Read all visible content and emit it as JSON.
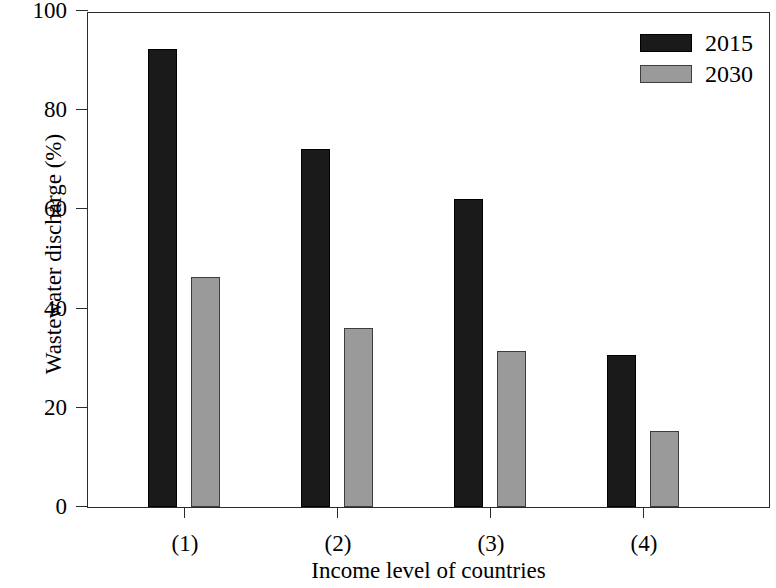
{
  "chart_data": {
    "type": "bar",
    "title": "",
    "subtitle": "",
    "xlabel": "Income level of countries",
    "ylabel": "Wastewater discharge (%)",
    "categories": [
      "(1)",
      "(2)",
      "(3)",
      "(4)"
    ],
    "series": [
      {
        "name": "2015",
        "color": "#1a1a1a",
        "values": [
          92.3,
          72.2,
          62.1,
          30.6
        ]
      },
      {
        "name": "2030",
        "color": "#9a9a9a",
        "values": [
          46.4,
          36.0,
          31.5,
          15.3
        ]
      }
    ],
    "ylim": [
      0,
      100
    ],
    "yticks": [
      0,
      20,
      40,
      60,
      80,
      100
    ],
    "ytick_labels": [
      "0",
      "20",
      "40",
      "60",
      "80",
      "100"
    ],
    "grid": false,
    "legend_position": "top-right",
    "legend_entries": [
      "2015",
      "2030"
    ],
    "annotations": []
  },
  "figure": {
    "background": "#ffffff",
    "axis_color": "#2b2b2b"
  }
}
